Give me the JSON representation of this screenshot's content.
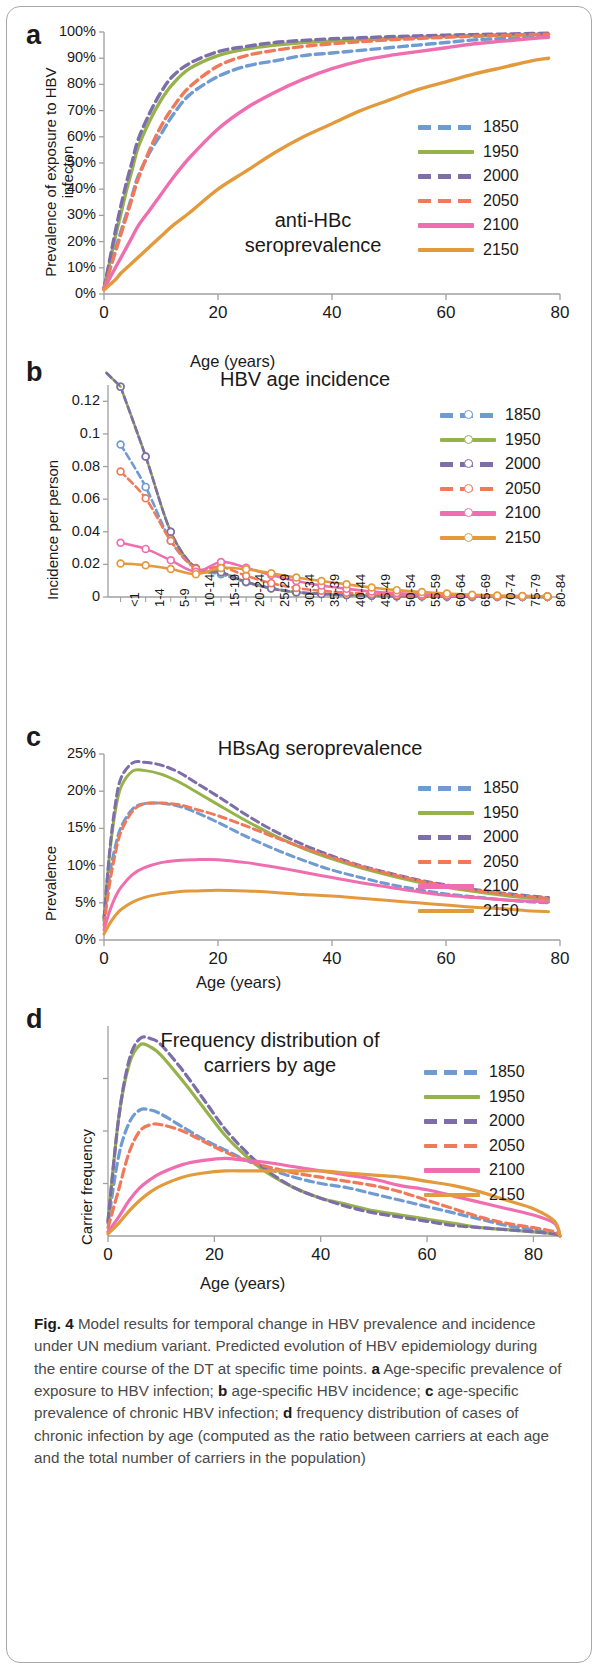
{
  "figure": {
    "caption_label": "Fig. 4",
    "caption_text": " Model results for temporal change in HBV prevalence and incidence under UN medium variant. Predicted evolution of HBV epidemiology during the entire course of the DT at specific time points. ",
    "caption_a_tag": "a",
    "caption_a_text": " Age-specific prevalence of exposure to HBV infection; ",
    "caption_b_tag": "b",
    "caption_b_text": " age-specific HBV incidence; ",
    "caption_c_tag": "c",
    "caption_c_text": " age-specific prevalence of chronic HBV infection; ",
    "caption_d_tag": "d",
    "caption_d_text": " frequency distribution of cases of chronic infection by age (computed as the ratio between carriers at each age and the total number of carriers in the population)"
  },
  "colors": {
    "1850": "#6f9bd1",
    "1950": "#96b24a",
    "2000": "#7d6da9",
    "2050": "#f0795a",
    "2100": "#ef6eb0",
    "2150": "#e39a3c",
    "axis": "#a0a0a0",
    "text": "#1a1a1a"
  },
  "legend_years": [
    "1850",
    "1950",
    "2000",
    "2050",
    "2100",
    "2150"
  ],
  "panels": {
    "a": {
      "letter": "a",
      "title": "anti-HBc\nseroprevalence",
      "title_line1": "anti-HBc",
      "title_line2": "seroprevalence",
      "ylabel": "Prevalence of exposure to HBV infecton",
      "xlabel": "Age (years)",
      "yticks": [
        "0%",
        "10%",
        "20%",
        "30%",
        "40%",
        "50%",
        "60%",
        "70%",
        "80%",
        "90%",
        "100%"
      ],
      "xticks": [
        "0",
        "20",
        "40",
        "60",
        "80"
      ]
    },
    "b": {
      "letter": "b",
      "title": "HBV age incidence",
      "ylabel": "Incidence per person",
      "xlabel": "",
      "yticks": [
        "0",
        "0.02",
        "0.04",
        "0.06",
        "0.08",
        "0.1",
        "0.12"
      ],
      "xticks": [
        "<1",
        "1-4",
        "5-9",
        "10-14",
        "15-19",
        "20-24",
        "25-29",
        "30-34",
        "35-39",
        "40-44",
        "45-49",
        "50-54",
        "55-59",
        "60-64",
        "65-69",
        "70-74",
        "75-79",
        "80-84"
      ]
    },
    "c": {
      "letter": "c",
      "title": "HBsAg seroprevalence",
      "ylabel": "Prevalence",
      "xlabel": "Age (years)",
      "yticks": [
        "0%",
        "5%",
        "10%",
        "15%",
        "20%",
        "25%"
      ],
      "xticks": [
        "0",
        "20",
        "40",
        "60",
        "80"
      ]
    },
    "d": {
      "letter": "d",
      "title_line1": "Frequency distribution of",
      "title_line2": "carriers by age",
      "ylabel": "Carrier frequency",
      "xlabel": "Age (years)",
      "yticks": [],
      "xticks": [
        "0",
        "20",
        "40",
        "60",
        "80"
      ]
    }
  },
  "chart_data": [
    {
      "type": "line",
      "panel": "a",
      "title": "anti-HBc seroprevalence",
      "xlabel": "Age (years)",
      "ylabel": "Prevalence of exposure to HBV infecton",
      "xlim": [
        0,
        80
      ],
      "ylim": [
        0,
        100
      ],
      "yunit": "%",
      "grid": false,
      "legend": "right",
      "x": [
        0,
        1,
        2,
        3,
        4,
        5,
        6,
        8,
        10,
        12,
        15,
        20,
        25,
        30,
        35,
        40,
        45,
        50,
        55,
        60,
        65,
        70,
        75,
        78
      ],
      "series": [
        {
          "name": "1850",
          "dash": "dashed",
          "values": [
            2,
            10,
            17,
            24,
            31,
            38,
            45,
            54,
            61,
            68,
            76,
            83,
            87,
            89,
            91,
            92,
            93,
            94,
            95,
            96,
            97,
            97.5,
            98,
            98.5
          ]
        },
        {
          "name": "1950",
          "dash": "solid",
          "values": [
            2,
            12,
            22,
            31,
            40,
            48,
            56,
            66,
            74,
            80,
            86,
            91,
            93.5,
            95,
            96,
            96.5,
            97,
            97.5,
            98,
            98.3,
            98.6,
            98.8,
            99,
            99.2
          ]
        },
        {
          "name": "2000",
          "dash": "dashed",
          "values": [
            2,
            13,
            24,
            34,
            43,
            51,
            59,
            69,
            77,
            83,
            88,
            92.5,
            94.5,
            96,
            96.8,
            97.4,
            97.8,
            98.2,
            98.5,
            98.8,
            99,
            99.2,
            99.4,
            99.5
          ]
        },
        {
          "name": "2050",
          "dash": "dashed",
          "values": [
            2,
            9,
            16,
            23,
            30,
            37,
            44,
            55,
            64,
            71,
            79,
            87,
            91,
            93,
            94.5,
            95.5,
            96.3,
            97,
            97.5,
            98,
            98.4,
            98.7,
            99,
            99.2
          ]
        },
        {
          "name": "2100",
          "dash": "solid",
          "values": [
            2,
            6,
            10,
            14,
            18,
            22,
            26,
            32,
            38,
            44,
            52,
            63,
            71,
            77,
            82,
            86,
            89,
            91,
            92.5,
            94,
            95.5,
            96.5,
            97.5,
            98
          ]
        },
        {
          "name": "2150",
          "dash": "solid",
          "values": [
            1.5,
            3.5,
            5.5,
            8,
            10,
            12,
            14,
            18,
            22,
            26,
            31,
            40,
            47,
            54,
            60,
            65,
            70,
            74,
            78,
            81,
            84,
            86.5,
            89,
            90
          ]
        }
      ]
    },
    {
      "type": "line",
      "panel": "b",
      "title": "HBV age incidence",
      "xlabel": "",
      "ylabel": "Incidence per person",
      "categories": [
        "<1",
        "1-4",
        "5-9",
        "10-14",
        "15-19",
        "20-24",
        "25-29",
        "30-34",
        "35-39",
        "40-44",
        "45-49",
        "50-54",
        "55-59",
        "60-64",
        "65-69",
        "70-74",
        "75-79",
        "80-84"
      ],
      "ylim": [
        0,
        0.13
      ],
      "markers": "circle",
      "grid": false,
      "legend": "right",
      "series": [
        {
          "name": "1850",
          "dash": "dashed",
          "values": [
            0.0935,
            0.0675,
            0.0345,
            0.0175,
            0.014,
            0.009,
            0.0055,
            0.003,
            0.002,
            0.0013,
            0.0009,
            0.0006,
            0.0004,
            0.0003,
            0.0002,
            0.0001,
            0.0001,
            0.0001
          ]
        },
        {
          "name": "1950",
          "dash": "solid",
          "values": [
            0.129,
            0.0862,
            0.04,
            0.0175,
            0.015,
            0.0092,
            0.0052,
            0.0028,
            0.0018,
            0.0012,
            0.0008,
            0.0005,
            0.0004,
            0.0003,
            0.0002,
            0.0001,
            0.0001,
            0.0001
          ]
        },
        {
          "name": "2000",
          "dash": "dashed",
          "values": [
            0.129,
            0.0862,
            0.04,
            0.0178,
            0.0152,
            0.0093,
            0.0053,
            0.0029,
            0.0019,
            0.0012,
            0.0008,
            0.0005,
            0.0004,
            0.0003,
            0.0002,
            0.0001,
            0.0001,
            0.0001
          ]
        },
        {
          "name": "2050",
          "dash": "dashed",
          "values": [
            0.077,
            0.0605,
            0.0345,
            0.0175,
            0.0185,
            0.013,
            0.0085,
            0.0055,
            0.0038,
            0.0026,
            0.0018,
            0.0012,
            0.0008,
            0.0006,
            0.0004,
            0.0003,
            0.0002,
            0.0002
          ]
        },
        {
          "name": "2100",
          "dash": "solid",
          "values": [
            0.0333,
            0.0295,
            0.0225,
            0.0155,
            0.0215,
            0.018,
            0.0135,
            0.0098,
            0.007,
            0.005,
            0.0034,
            0.0024,
            0.0016,
            0.0011,
            0.0008,
            0.0005,
            0.0004,
            0.0003
          ]
        },
        {
          "name": "2150",
          "dash": "solid",
          "values": [
            0.0205,
            0.0195,
            0.0172,
            0.014,
            0.0178,
            0.017,
            0.0145,
            0.012,
            0.0098,
            0.0078,
            0.0058,
            0.0042,
            0.003,
            0.0021,
            0.0014,
            0.0009,
            0.0006,
            0.0004
          ]
        }
      ]
    },
    {
      "type": "line",
      "panel": "c",
      "title": "HBsAg seroprevalence",
      "xlabel": "Age (years)",
      "ylabel": "Prevalence",
      "xlim": [
        0,
        80
      ],
      "ylim": [
        0,
        25
      ],
      "yunit": "%",
      "grid": false,
      "legend": "right",
      "x": [
        0,
        1,
        2,
        3,
        5,
        7,
        10,
        13,
        16,
        20,
        25,
        30,
        35,
        40,
        45,
        50,
        55,
        60,
        65,
        70,
        75,
        78
      ],
      "series": [
        {
          "name": "1850",
          "dash": "dashed",
          "values": [
            2.6,
            8.8,
            12.6,
            15.2,
            17.6,
            18.3,
            18.4,
            18.0,
            17.2,
            15.8,
            13.9,
            12.2,
            10.7,
            9.4,
            8.4,
            7.5,
            6.8,
            6.2,
            5.8,
            5.4,
            5.1,
            5.0
          ]
        },
        {
          "name": "1950",
          "dash": "solid",
          "values": [
            2.9,
            11.6,
            17.4,
            20.6,
            22.7,
            22.8,
            22.3,
            21.3,
            20.0,
            18.2,
            16.0,
            14.0,
            12.3,
            10.9,
            9.7,
            8.7,
            7.8,
            7.1,
            6.5,
            6.0,
            5.6,
            5.4
          ]
        },
        {
          "name": "2000",
          "dash": "dashed",
          "values": [
            2.9,
            12.0,
            18.3,
            21.8,
            23.8,
            23.9,
            23.5,
            22.6,
            21.2,
            19.3,
            16.8,
            14.6,
            12.8,
            11.3,
            10.0,
            9.0,
            8.1,
            7.4,
            6.8,
            6.3,
            5.9,
            5.7
          ]
        },
        {
          "name": "2050",
          "dash": "dashed",
          "values": [
            2.0,
            7.6,
            11.7,
            14.6,
            17.3,
            18.3,
            18.4,
            18.2,
            17.6,
            16.7,
            15.3,
            13.8,
            12.4,
            11.1,
            9.9,
            8.9,
            8.0,
            7.3,
            6.7,
            6.2,
            5.8,
            5.6
          ]
        },
        {
          "name": "2100",
          "dash": "solid",
          "values": [
            1.4,
            3.9,
            5.8,
            7.1,
            8.8,
            9.7,
            10.4,
            10.7,
            10.8,
            10.8,
            10.4,
            9.8,
            9.1,
            8.4,
            7.7,
            7.1,
            6.5,
            6.0,
            5.7,
            5.4,
            5.2,
            5.1
          ]
        },
        {
          "name": "2150",
          "dash": "solid",
          "values": [
            0.8,
            2.2,
            3.3,
            4.1,
            5.1,
            5.7,
            6.2,
            6.5,
            6.6,
            6.7,
            6.6,
            6.4,
            6.1,
            5.9,
            5.6,
            5.3,
            5.0,
            4.7,
            4.4,
            4.2,
            3.9,
            3.8
          ]
        }
      ]
    },
    {
      "type": "line",
      "panel": "d",
      "title": "Frequency distribution of carriers by age",
      "xlabel": "Age (years)",
      "ylabel": "Carrier frequency",
      "xlim": [
        0,
        85
      ],
      "ylim": [
        0,
        1
      ],
      "grid": false,
      "legend": "right",
      "x": [
        0,
        2,
        4,
        6,
        8,
        10,
        14,
        18,
        22,
        26,
        30,
        35,
        40,
        45,
        50,
        55,
        60,
        65,
        70,
        75,
        80,
        84,
        85
      ],
      "series": [
        {
          "name": "1850",
          "dash": "dashed",
          "values": [
            0.06,
            0.38,
            0.54,
            0.6,
            0.6,
            0.58,
            0.52,
            0.46,
            0.41,
            0.36,
            0.32,
            0.28,
            0.25,
            0.23,
            0.2,
            0.17,
            0.14,
            0.11,
            0.08,
            0.05,
            0.03,
            0.01,
            0.0
          ]
        },
        {
          "name": "1950",
          "dash": "solid",
          "values": [
            0.07,
            0.56,
            0.82,
            0.91,
            0.9,
            0.86,
            0.74,
            0.61,
            0.48,
            0.38,
            0.3,
            0.23,
            0.18,
            0.15,
            0.12,
            0.1,
            0.08,
            0.06,
            0.04,
            0.03,
            0.02,
            0.01,
            0.0
          ]
        },
        {
          "name": "2000",
          "dash": "dashed",
          "values": [
            0.07,
            0.56,
            0.84,
            0.94,
            0.94,
            0.91,
            0.79,
            0.65,
            0.51,
            0.4,
            0.31,
            0.23,
            0.18,
            0.14,
            0.11,
            0.09,
            0.07,
            0.05,
            0.04,
            0.03,
            0.02,
            0.01,
            0.0
          ]
        },
        {
          "name": "2050",
          "dash": "dashed",
          "values": [
            0.04,
            0.22,
            0.4,
            0.5,
            0.53,
            0.53,
            0.5,
            0.45,
            0.4,
            0.36,
            0.33,
            0.3,
            0.28,
            0.26,
            0.24,
            0.21,
            0.17,
            0.13,
            0.09,
            0.06,
            0.04,
            0.02,
            0.0
          ]
        },
        {
          "name": "2100",
          "dash": "solid",
          "values": [
            0.02,
            0.09,
            0.17,
            0.23,
            0.27,
            0.3,
            0.34,
            0.36,
            0.37,
            0.36,
            0.35,
            0.33,
            0.31,
            0.29,
            0.27,
            0.24,
            0.22,
            0.19,
            0.16,
            0.13,
            0.1,
            0.06,
            0.0
          ]
        },
        {
          "name": "2150",
          "dash": "solid",
          "values": [
            0.01,
            0.06,
            0.12,
            0.17,
            0.21,
            0.24,
            0.28,
            0.3,
            0.31,
            0.31,
            0.31,
            0.31,
            0.31,
            0.3,
            0.29,
            0.28,
            0.26,
            0.24,
            0.21,
            0.17,
            0.13,
            0.07,
            0.0
          ]
        }
      ]
    }
  ]
}
